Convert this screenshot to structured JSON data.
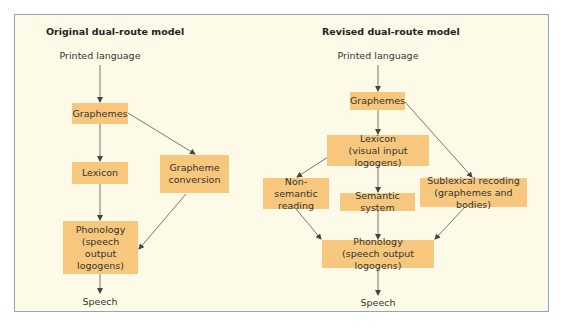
{
  "colors": {
    "background": "#fdfbe7",
    "frame_border": "#8fa6c2",
    "box_fill": "#f6c77c",
    "arrow": "#444444",
    "text": "#333333"
  },
  "left_model": {
    "title": "Original dual-route model",
    "input": "Printed language",
    "graphemes": "Graphemes",
    "lexicon": "Lexicon",
    "grapheme_conversion_line1": "Grapheme",
    "grapheme_conversion_line2": "conversion",
    "phonology_line1": "Phonology",
    "phonology_line2": "(speech output",
    "phonology_line3": "logogens)",
    "output": "Speech"
  },
  "right_model": {
    "title": "Revised dual-route model",
    "input": "Printed language",
    "graphemes": "Graphemes",
    "lexicon_line1": "Lexicon",
    "lexicon_line2": "(visual input logogens)",
    "non_semantic_line1": "Non-semantic",
    "non_semantic_line2": "reading",
    "semantic_system": "Semantic system",
    "sublexical_line1": "Sublexical recoding",
    "sublexical_line2": "(graphemes and bodies)",
    "phonology_line1": "Phonology",
    "phonology_line2": "(speech output logogens)",
    "output": "Speech"
  }
}
